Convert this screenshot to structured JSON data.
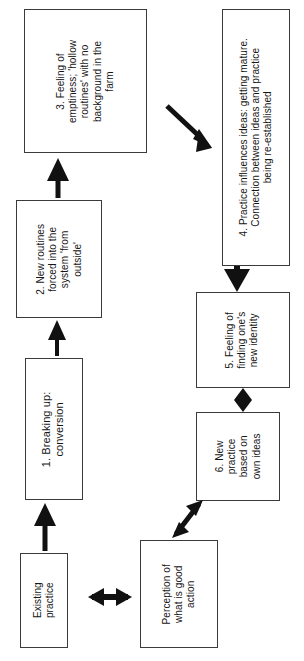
{
  "diagram": {
    "background_color": "#ffffff",
    "stroke_color": "#3a3a3a",
    "arrow_color": "#111111",
    "text_color": "#161616",
    "nodes": [
      {
        "id": "box3",
        "label": "3. Feeling of\nemptiness; 'hollow\nroutines' with no\nbackground in the\nfarm"
      },
      {
        "id": "box4",
        "label": "4. Practice influences ideas: getting mature.\nConnection between ideas and practice\nbeing re-established"
      },
      {
        "id": "box2",
        "label": "2. New routines\nforced into the\nsystem 'from\noutside'"
      },
      {
        "id": "box5",
        "label": "5. Feeling of\nfinding one's\nnew identity"
      },
      {
        "id": "box1",
        "label": "1. Breaking up:\nconversion"
      },
      {
        "id": "box6",
        "label": "6. New\npractice\nbased on\nown ideas"
      },
      {
        "id": "existing_practice",
        "label": "Existing\npractice"
      },
      {
        "id": "perception",
        "label": "Perception of\nwhat is good\naction"
      }
    ],
    "connectors": [
      {
        "id": "existing-to-box1",
        "kind": "arrow-up",
        "from": "existing_practice",
        "to": "box1"
      },
      {
        "id": "box1-to-box2",
        "kind": "arrow-up",
        "from": "box1",
        "to": "box2"
      },
      {
        "id": "box2-to-box3",
        "kind": "arrow-up",
        "from": "box2",
        "to": "box3"
      },
      {
        "id": "box3-to-box4",
        "kind": "arrow-diagonal-down-right",
        "from": "box3",
        "to": "box4"
      },
      {
        "id": "box4-to-box5",
        "kind": "arrow-down",
        "from": "box4",
        "to": "box5"
      },
      {
        "id": "box5-to-box6",
        "kind": "diamond",
        "from": "box5",
        "to": "box6"
      },
      {
        "id": "box6-to-perception",
        "kind": "arrow-double-diagonal",
        "from": "box6",
        "to": "perception"
      },
      {
        "id": "existing-to-perception",
        "kind": "arrow-double-horizontal",
        "from": "existing_practice",
        "to": "perception"
      }
    ]
  }
}
